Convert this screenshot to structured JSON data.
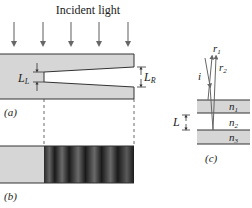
{
  "title": "Incident light",
  "panels": {
    "a": {
      "label": "(a)",
      "left_gap": "L",
      "left_gap_sub": "L",
      "right_gap": "L",
      "right_gap_sub": "R"
    },
    "b": {
      "label": "(b)"
    },
    "c": {
      "label": "(c)",
      "rays": {
        "incident": "i",
        "r1": "r",
        "r1_sub": "1",
        "r2": "r",
        "r2_sub": "2"
      },
      "layers": [
        {
          "n": "n",
          "sub": "1"
        },
        {
          "n": "n",
          "sub": "2"
        },
        {
          "n": "n",
          "sub": "3"
        }
      ],
      "thickness": "L"
    }
  },
  "colors": {
    "slab": "#d6d6d6",
    "line": "#333333",
    "fringe_dark": "#1a1a1a",
    "fringe_light": "#6a6a6a"
  }
}
